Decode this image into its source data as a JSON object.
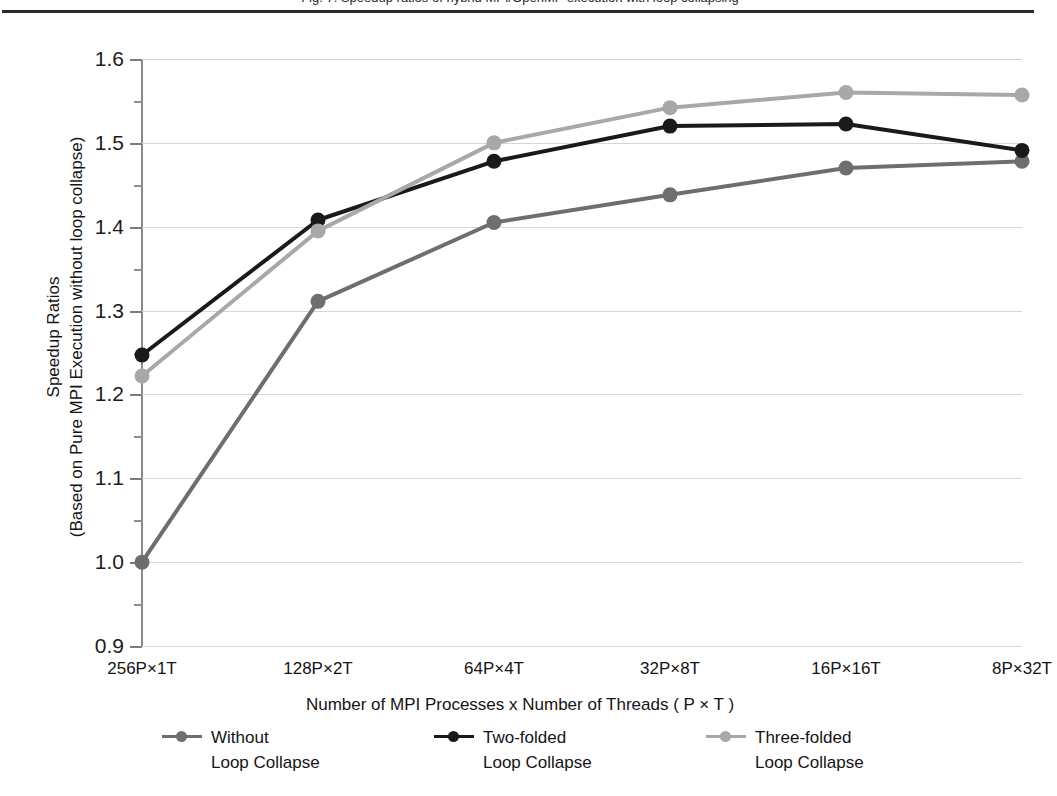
{
  "figure": {
    "caption_clipped": "Fig. 7. Speedup ratios of hybrid MPI/OpenMP execution with loop collapsing"
  },
  "chart_data": {
    "type": "line",
    "title": "",
    "xlabel": "Number of MPI Processes x Number of Threads ( P × T )",
    "ylabel": "Speedup Ratios (Based on Pure MPI Execution without loop collapse)",
    "ylabel_lines": [
      "Speedup Ratios",
      "(Based on Pure MPI Execution without loop collapse)"
    ],
    "categories": [
      "256P×1T",
      "128P×2T",
      "64P×4T",
      "32P×8T",
      "16P×16T",
      "8P×32T"
    ],
    "ylim": [
      0.9,
      1.6
    ],
    "yticks": [
      0.9,
      1.0,
      1.1,
      1.2,
      1.3,
      1.4,
      1.5,
      1.6
    ],
    "ytick_labels": [
      "0.9",
      "1.0",
      "1.1",
      "1.2",
      "1.3",
      "1.4",
      "1.5",
      "1.6"
    ],
    "yticks_minor": [
      0.95,
      1.05,
      1.15,
      1.25,
      1.35,
      1.45,
      1.55
    ],
    "grid": true,
    "grid_axis": "y",
    "legend_position": "bottom",
    "series": [
      {
        "name": "Without Loop Collapse",
        "name_lines": [
          "Without",
          "Loop Collapse"
        ],
        "color": "#6e6e6e",
        "values": [
          1.0,
          1.311,
          1.405,
          1.438,
          1.47,
          1.478
        ]
      },
      {
        "name": "Two-folded Loop Collapse",
        "name_lines": [
          "Two-folded",
          "Loop Collapse"
        ],
        "color": "#1a1a1a",
        "values": [
          1.247,
          1.408,
          1.478,
          1.52,
          1.5225,
          1.491
        ]
      },
      {
        "name": "Three-folded Loop Collapse",
        "name_lines": [
          "Three-folded",
          "Loop Collapse"
        ],
        "color": "#a8a8a8",
        "values": [
          1.222,
          1.395,
          1.5,
          1.542,
          1.56,
          1.557
        ]
      }
    ]
  },
  "style": {
    "axis_color": "#8a8a8a",
    "grid_color": "#d6d6d6",
    "text_color": "#141414",
    "rule_color": "#2b2b2b",
    "background": "#ffffff"
  }
}
